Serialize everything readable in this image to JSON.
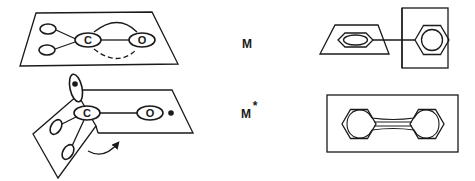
{
  "diagram": {
    "states": {
      "ground": {
        "label": "M"
      },
      "excited": {
        "label": "M",
        "superscript": "*"
      }
    },
    "left_panel": {
      "ground_molecule": {
        "atoms": [
          {
            "label": "C"
          },
          {
            "label": "O"
          }
        ]
      },
      "excited_molecule": {
        "atoms": [
          {
            "label": "C"
          },
          {
            "label": "O"
          }
        ]
      }
    },
    "colors": {
      "ink": "#1a1a1a",
      "background": "#ffffff"
    }
  }
}
